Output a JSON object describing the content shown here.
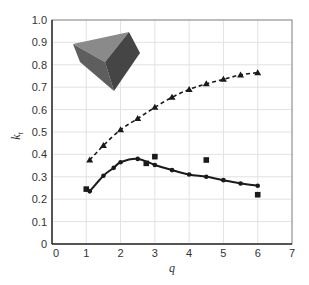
{
  "chart_data": {
    "type": "line",
    "title": "",
    "xlabel": "q",
    "ylabel": "k_t",
    "xlim": [
      0,
      7
    ],
    "ylim": [
      0,
      1.0
    ],
    "x_ticks": [
      "0",
      "1",
      "2",
      "3",
      "4",
      "5",
      "6",
      "7"
    ],
    "y_ticks": [
      "0",
      "0.1",
      "0.2",
      "0.3",
      "0.4",
      "0.5",
      "0.6",
      "0.7",
      "0.8",
      "0.9",
      "1.0"
    ],
    "grid": true,
    "legend": null,
    "inset": "gray-triangular-prism-polyhedron",
    "series": [
      {
        "name": "upper (dashed, triangles)",
        "style": "dashed",
        "marker": "triangle",
        "x": [
          1.1,
          1.5,
          2.0,
          2.5,
          3.0,
          3.5,
          4.0,
          4.5,
          5.0,
          5.5,
          6.0
        ],
        "y": [
          0.375,
          0.44,
          0.51,
          0.56,
          0.61,
          0.655,
          0.69,
          0.715,
          0.735,
          0.755,
          0.765
        ]
      },
      {
        "name": "lower (solid, diamonds)",
        "style": "solid",
        "marker": "diamond",
        "x": [
          1.1,
          1.5,
          1.8,
          2.0,
          2.5,
          3.0,
          3.5,
          4.0,
          4.5,
          5.0,
          5.5,
          6.0
        ],
        "y": [
          0.235,
          0.305,
          0.34,
          0.365,
          0.38,
          0.353,
          0.33,
          0.31,
          0.3,
          0.285,
          0.27,
          0.26
        ]
      },
      {
        "name": "squares (data points)",
        "style": "none",
        "marker": "square",
        "x": [
          1.0,
          2.75,
          3.0,
          4.5,
          6.0
        ],
        "y": [
          0.245,
          0.36,
          0.39,
          0.375,
          0.22
        ]
      }
    ]
  },
  "labels": {
    "xlabel": "q",
    "ylabel_main": "k",
    "ylabel_sub": "t"
  }
}
